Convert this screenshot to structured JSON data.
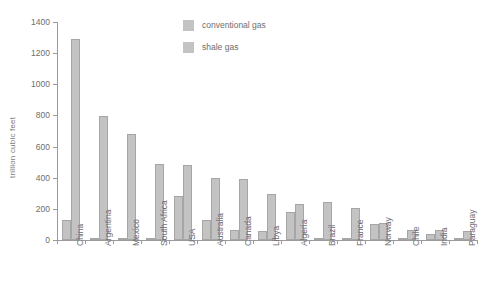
{
  "chart_data": {
    "type": "bar",
    "title": "",
    "xlabel": "",
    "ylabel": "trillion cubic feet",
    "ylim": [
      0,
      1400
    ],
    "ytick_step": 200,
    "yticks": [
      0,
      200,
      400,
      600,
      800,
      1000,
      1200,
      1400
    ],
    "grid": false,
    "legend_position": "top-center",
    "categories": [
      "China",
      "Argentina",
      "Mexico",
      "South Africa",
      "USA",
      "Australia",
      "Canada",
      "Libya",
      "Algeria",
      "Brazil",
      "France",
      "Norway",
      "Chile",
      "India",
      "Paraguay"
    ],
    "series": [
      {
        "name": "conventional gas",
        "color": "#c3c3c3",
        "values": [
          130,
          15,
          10,
          5,
          280,
          130,
          65,
          55,
          180,
          15,
          10,
          100,
          5,
          40,
          5
        ]
      },
      {
        "name": "shale gas",
        "color": "#c3c3c3",
        "values": [
          1290,
          795,
          680,
          485,
          480,
          400,
          390,
          295,
          230,
          245,
          205,
          110,
          65,
          65,
          60
        ]
      }
    ]
  },
  "axes": {
    "y_title": "trillion cubic feet"
  },
  "legend": {
    "items": [
      {
        "label": "conventional gas"
      },
      {
        "label": "shale gas"
      }
    ]
  }
}
